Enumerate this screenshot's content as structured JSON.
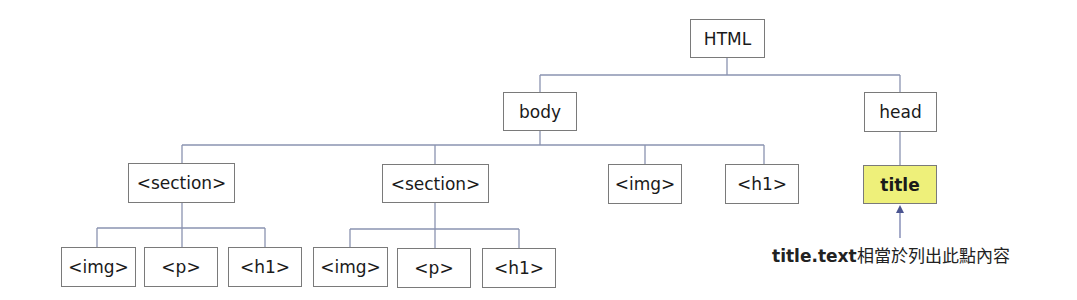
{
  "diagram": {
    "type": "tree",
    "colors": {
      "edge": "#8a93b0",
      "border": "#7a7a7a",
      "highlight_fill": "#eef07a",
      "arrow": "#6a74a6"
    },
    "nodes": {
      "html": {
        "label": "HTML"
      },
      "body": {
        "label": "body"
      },
      "head": {
        "label": "head"
      },
      "section1": {
        "label": "<section>"
      },
      "section2": {
        "label": "<section>"
      },
      "img_body": {
        "label": "<img>"
      },
      "h1_body": {
        "label": "<h1>"
      },
      "title": {
        "label": "title",
        "highlighted": true
      },
      "s1_img": {
        "label": "<img>"
      },
      "s1_p": {
        "label": "<p>"
      },
      "s1_h1": {
        "label": "<h1>"
      },
      "s2_img": {
        "label": "<img>"
      },
      "s2_p": {
        "label": "<p>"
      },
      "s2_h1": {
        "label": "<h1>"
      }
    },
    "edges": [
      [
        "html",
        "body"
      ],
      [
        "html",
        "head"
      ],
      [
        "body",
        "section1"
      ],
      [
        "body",
        "section2"
      ],
      [
        "body",
        "img_body"
      ],
      [
        "body",
        "h1_body"
      ],
      [
        "head",
        "title"
      ],
      [
        "section1",
        "s1_img"
      ],
      [
        "section1",
        "s1_p"
      ],
      [
        "section1",
        "s1_h1"
      ],
      [
        "section2",
        "s2_img"
      ],
      [
        "section2",
        "s2_p"
      ],
      [
        "section2",
        "s2_h1"
      ]
    ],
    "annotation": {
      "code": "title.text",
      "text": "相當於列出此點內容",
      "points_to": "title"
    }
  }
}
